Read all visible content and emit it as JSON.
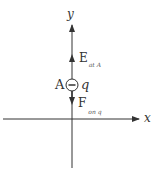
{
  "diagram": {
    "axes": {
      "x_label": "x",
      "y_label": "y"
    },
    "point": {
      "label": "A"
    },
    "charge": {
      "label": "q",
      "sign": "−"
    },
    "field_vector": {
      "symbol": "E",
      "subscript": "at A",
      "direction": "up"
    },
    "force_vector": {
      "symbol": "F",
      "subscript": "on q",
      "direction": "down"
    },
    "colors": {
      "stroke": "#333333"
    }
  }
}
